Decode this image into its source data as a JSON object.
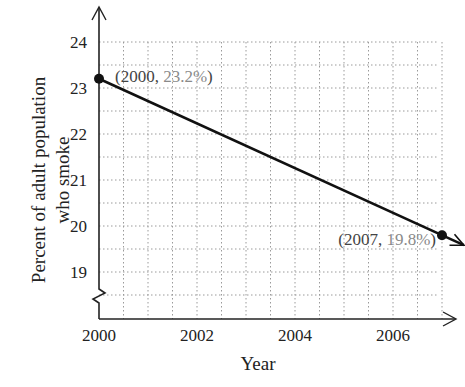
{
  "chart_data": {
    "type": "line",
    "title": "",
    "xlabel": "Year",
    "ylabel": "Percent of adult population who smoke",
    "ylabel_lines": [
      "Percent of adult population",
      "who smoke"
    ],
    "x_ticks": [
      "2000",
      "2002",
      "2004",
      "2006"
    ],
    "y_ticks": [
      "19",
      "20",
      "21",
      "22",
      "23",
      "24"
    ],
    "xlim": [
      2000,
      2007.3
    ],
    "ylim": [
      18,
      24
    ],
    "y_axis_break": true,
    "grid": true,
    "grid_style": "dotted",
    "series": [
      {
        "name": "Smoking rate",
        "x": [
          2000,
          2007
        ],
        "y": [
          23.2,
          19.8
        ],
        "line_extends_with_arrow": true
      }
    ],
    "annotations": [
      {
        "label_prefix": "(2000, ",
        "label_value": "23.2%",
        "label_suffix": ")",
        "x": 2000,
        "y": 23.2
      },
      {
        "label_prefix": "(2007, ",
        "label_value": "19.8%",
        "label_suffix": ")",
        "x": 2007,
        "y": 19.8
      }
    ]
  },
  "colors": {
    "line": "#111111",
    "grid": "#9a9a9a",
    "axis": "#222222",
    "annotation_value": "#8a8a8a"
  }
}
